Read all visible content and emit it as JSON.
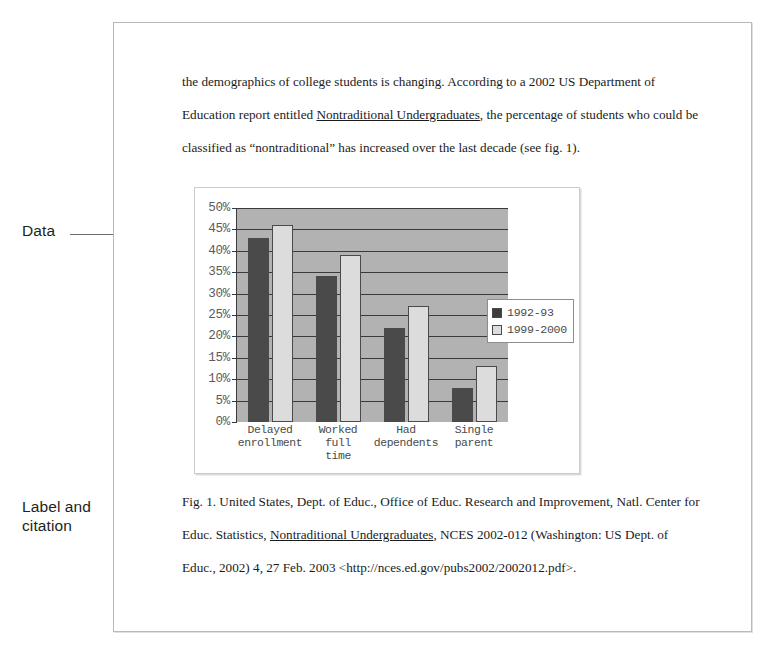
{
  "annotations": {
    "data_label": "Data",
    "label_citation": "Label and\ncitation"
  },
  "document": {
    "body_text_part1": "the demographics of college students is changing. According to a 2002 US Department of Education report entitled ",
    "body_text_title": "Nontraditional Undergraduates",
    "body_text_part2": ", the percentage of students who could be classified as “nontraditional” has increased over the last decade (see fig. 1).",
    "caption_part1": "Fig. 1. United States, Dept. of Educ., Office of Educ. Research and Improvement, Natl. Center for Educ. Statistics, ",
    "caption_title": "Nontraditional Undergraduates",
    "caption_part2": ", NCES 2002-012 (Washington: US Dept. of Educ., 2002) 4, 27 Feb. 2003 <http://nces.ed.gov/pubs2002/2002012.pdf>."
  },
  "chart_data": {
    "type": "bar",
    "title": "",
    "xlabel": "",
    "ylabel": "",
    "ylim": [
      0,
      50
    ],
    "grid": true,
    "legend_position": "right",
    "categories": [
      "Delayed\nenrollment",
      "Worked\nfull\ntime",
      "Had\ndependents",
      "Single\nparent"
    ],
    "ytick_labels": [
      "50%",
      "45%",
      "40%",
      "35%",
      "30%",
      "25%",
      "20%",
      "15%",
      "10%",
      "5%",
      "0%"
    ],
    "ytick_values": [
      50,
      45,
      40,
      35,
      30,
      25,
      20,
      15,
      10,
      5,
      0
    ],
    "series": [
      {
        "name": "1992-93",
        "color": "#4a4a4a",
        "values": [
          43,
          34,
          22,
          8
        ]
      },
      {
        "name": "1999-2000",
        "color": "#dcdcdc",
        "values": [
          46,
          39,
          27,
          13
        ]
      }
    ],
    "plot_background": "#b2b2b2"
  }
}
